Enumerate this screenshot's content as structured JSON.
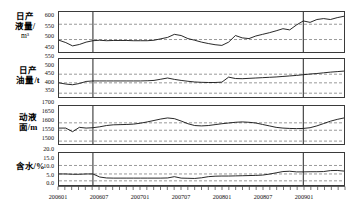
{
  "chart_data": {
    "type": "line",
    "title": "",
    "xlabel": "",
    "grid": "dashed-reference-lines",
    "legend": "none",
    "x_tick_labels": [
      "200601",
      "200607",
      "200701",
      "200707",
      "200801",
      "200807",
      "200901"
    ],
    "x_range": [
      "200601",
      "200906"
    ],
    "x_points": 42,
    "vertical_markers": [
      "200606",
      "200812"
    ],
    "panels": [
      {
        "name": "daily-liquid-production",
        "ylabel": "日产液量/",
        "yunit": "m",
        "yunit_sup": "3",
        "ylabel_line1": "日产",
        "ylabel_line2": "液量/",
        "ylabel_line3": "m³",
        "yticks": [
          "600",
          "550",
          "500",
          "450"
        ],
        "ylim": [
          430,
          600
        ],
        "ref_lines": [
          548,
          483
        ],
        "values": [
          480,
          470,
          456,
          462,
          472,
          478,
          480,
          478,
          479,
          479,
          479,
          478,
          478,
          478,
          480,
          486,
          492,
          505,
          500,
          487,
          480,
          472,
          466,
          461,
          458,
          472,
          500,
          490,
          487,
          498,
          505,
          512,
          520,
          529,
          524,
          545,
          562,
          556,
          568,
          572,
          568,
          576,
          582
        ]
      },
      {
        "name": "daily-oil-production",
        "ylabel": "日产油量/t",
        "ylabel_line1": "日产",
        "ylabel_line2": "油量/t",
        "yticks": [
          "550",
          "500",
          "450",
          "400",
          "350"
        ],
        "ylim": [
          330,
          550
        ],
        "ref_lines": [
          462,
          412,
          352
        ],
        "values": [
          412,
          405,
          401,
          408,
          420,
          423,
          423,
          423,
          423,
          423,
          423,
          423,
          423,
          424,
          426,
          433,
          440,
          432,
          426,
          421,
          417,
          415,
          414,
          414,
          416,
          445,
          437,
          436,
          438,
          440,
          442,
          444,
          446,
          449,
          452,
          455,
          459,
          463,
          466,
          470,
          474,
          477,
          480
        ]
      },
      {
        "name": "dynamic-liquid-level",
        "ylabel": "动液面/m",
        "ylabel_line1": "动液",
        "ylabel_line2": "面/m",
        "yticks": [
          "1700",
          "1650",
          "1600",
          "1550",
          "1500"
        ],
        "ylim": [
          1490,
          1700
        ],
        "ref_lines": [
          1607,
          1566,
          1506
        ],
        "values": [
          1578,
          1578,
          1558,
          1582,
          1578,
          1580,
          1585,
          1592,
          1596,
          1597,
          1598,
          1600,
          1605,
          1612,
          1620,
          1628,
          1634,
          1630,
          1617,
          1602,
          1592,
          1590,
          1592,
          1597,
          1602,
          1606,
          1610,
          1612,
          1610,
          1606,
          1598,
          1590,
          1582,
          1578,
          1576,
          1575,
          1576,
          1580,
          1590,
          1603,
          1616,
          1626,
          1634
        ]
      },
      {
        "name": "water-cut",
        "ylabel": "含水/%",
        "ylabel_line1": "含水/%",
        "yticks": [
          "20.0",
          "15.0",
          "10.0",
          "5.0",
          "0.0"
        ],
        "ylim": [
          0,
          20
        ],
        "ref_lines": [
          12.2,
          6.9,
          2.6
        ],
        "values": [
          6.9,
          6.9,
          6.7,
          6.7,
          6.9,
          6.9,
          5.0,
          4.4,
          4.3,
          4.3,
          4.3,
          4.3,
          4.3,
          4.3,
          4.3,
          4.3,
          4.4,
          5.2,
          4.3,
          4.2,
          4.1,
          4.5,
          5.2,
          5.5,
          5.6,
          5.6,
          5.7,
          5.8,
          5.9,
          6.0,
          6.2,
          6.8,
          7.6,
          8.4,
          8.6,
          8.2,
          8.2,
          8.3,
          8.3,
          8.4,
          9.0,
          9.1,
          8.7
        ]
      }
    ]
  }
}
